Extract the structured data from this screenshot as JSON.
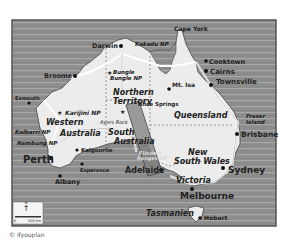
{
  "map": {
    "title": "Australia",
    "colors": {
      "sea": "#8c8c8c",
      "sea_lines": "#a9a9a9",
      "land": "#ececec",
      "frame": "#555555",
      "highlight_band": "#8a8a8a"
    },
    "states": [
      {
        "name": "Western Australia",
        "lines": [
          "Western",
          "Australia"
        ]
      },
      {
        "name": "Northern Territory",
        "lines": [
          "Northern",
          "Territory"
        ]
      },
      {
        "name": "South Australia",
        "lines": [
          "South",
          "Australia"
        ]
      },
      {
        "name": "Queensland",
        "lines": [
          "Queensland"
        ]
      },
      {
        "name": "New South Wales",
        "lines": [
          "New",
          "South Wales"
        ]
      },
      {
        "name": "Victoria",
        "lines": [
          "Victoria"
        ]
      },
      {
        "name": "Tasmanien",
        "lines": [
          "Tasmanien"
        ]
      }
    ],
    "cities": [
      {
        "name": "Darwin"
      },
      {
        "name": "Broome"
      },
      {
        "name": "Exmouth"
      },
      {
        "name": "Perth"
      },
      {
        "name": "Albany"
      },
      {
        "name": "Kalgoorlie"
      },
      {
        "name": "Esperance"
      },
      {
        "name": "Adelaide"
      },
      {
        "name": "Melbourne"
      },
      {
        "name": "Hobart"
      },
      {
        "name": "Sydney"
      },
      {
        "name": "Brisbane"
      },
      {
        "name": "Townsville"
      },
      {
        "name": "Cairns"
      },
      {
        "name": "Cooktown"
      },
      {
        "name": "Mt. Isa"
      },
      {
        "name": "Alice Springs"
      }
    ],
    "parks": [
      {
        "name": "Kakadu NP"
      },
      {
        "name": "Bungle Bungle NP",
        "lines": [
          "Bungle",
          "Bungle NP"
        ]
      },
      {
        "name": "Karijini NP"
      },
      {
        "name": "Kalbarri NP"
      },
      {
        "name": "Nambung NP"
      },
      {
        "name": "Ayers Rock"
      },
      {
        "name": "Flinders Ranges NP",
        "lines": [
          "Flinders",
          "Ranges NP"
        ]
      }
    ],
    "features": [
      {
        "name": "Cape York"
      },
      {
        "name": "Fraser Island",
        "lines": [
          "Fraser",
          "Island"
        ]
      }
    ],
    "scale": {
      "start": "0",
      "end": "500 km",
      "north": "N"
    },
    "copyright": "© ifyouplan"
  }
}
